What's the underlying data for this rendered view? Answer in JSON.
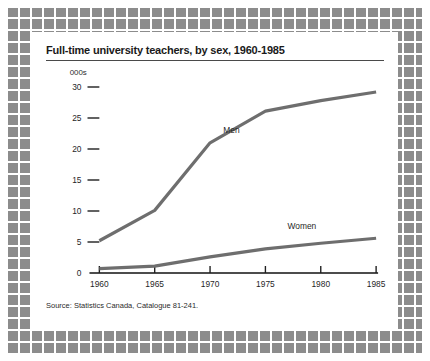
{
  "chart_data": {
    "type": "line",
    "title": "Full-time university teachers, by sex, 1960-1985",
    "unit_label": "000s",
    "xlabel": "",
    "ylabel": "",
    "x": [
      1960,
      1965,
      1970,
      1975,
      1980,
      1985
    ],
    "xtick_labels": [
      "1960",
      "1965",
      "1970",
      "1975",
      "1980",
      "1985"
    ],
    "ytick_labels": [
      "30",
      "25",
      "20",
      "15",
      "10",
      "5",
      "0"
    ],
    "yticks": [
      30,
      25,
      20,
      15,
      10,
      5,
      0
    ],
    "ylim": [
      0,
      31
    ],
    "xlim": [
      1960,
      1985
    ],
    "grid": false,
    "legend_position": "inline-annotation",
    "series": [
      {
        "name": "Men",
        "values": [
          5.2,
          10.1,
          21.0,
          26.1,
          27.8,
          29.2
        ],
        "color": "#6e6e6e",
        "label_x": 1971.2,
        "label_y": 22.6
      },
      {
        "name": "Women",
        "values": [
          0.7,
          1.1,
          2.6,
          3.9,
          4.8,
          5.6
        ],
        "color": "#6e6e6e",
        "label_x": 1977.0,
        "label_y": 7.1
      }
    ],
    "source": "Source: Statistics Canada, Catalogue 81-241."
  },
  "colors": {
    "frame_square": "#8c8c8c",
    "line": "#6e6e6e",
    "axis": "#111111",
    "text": "#1f1f1f",
    "background": "#ffffff"
  }
}
